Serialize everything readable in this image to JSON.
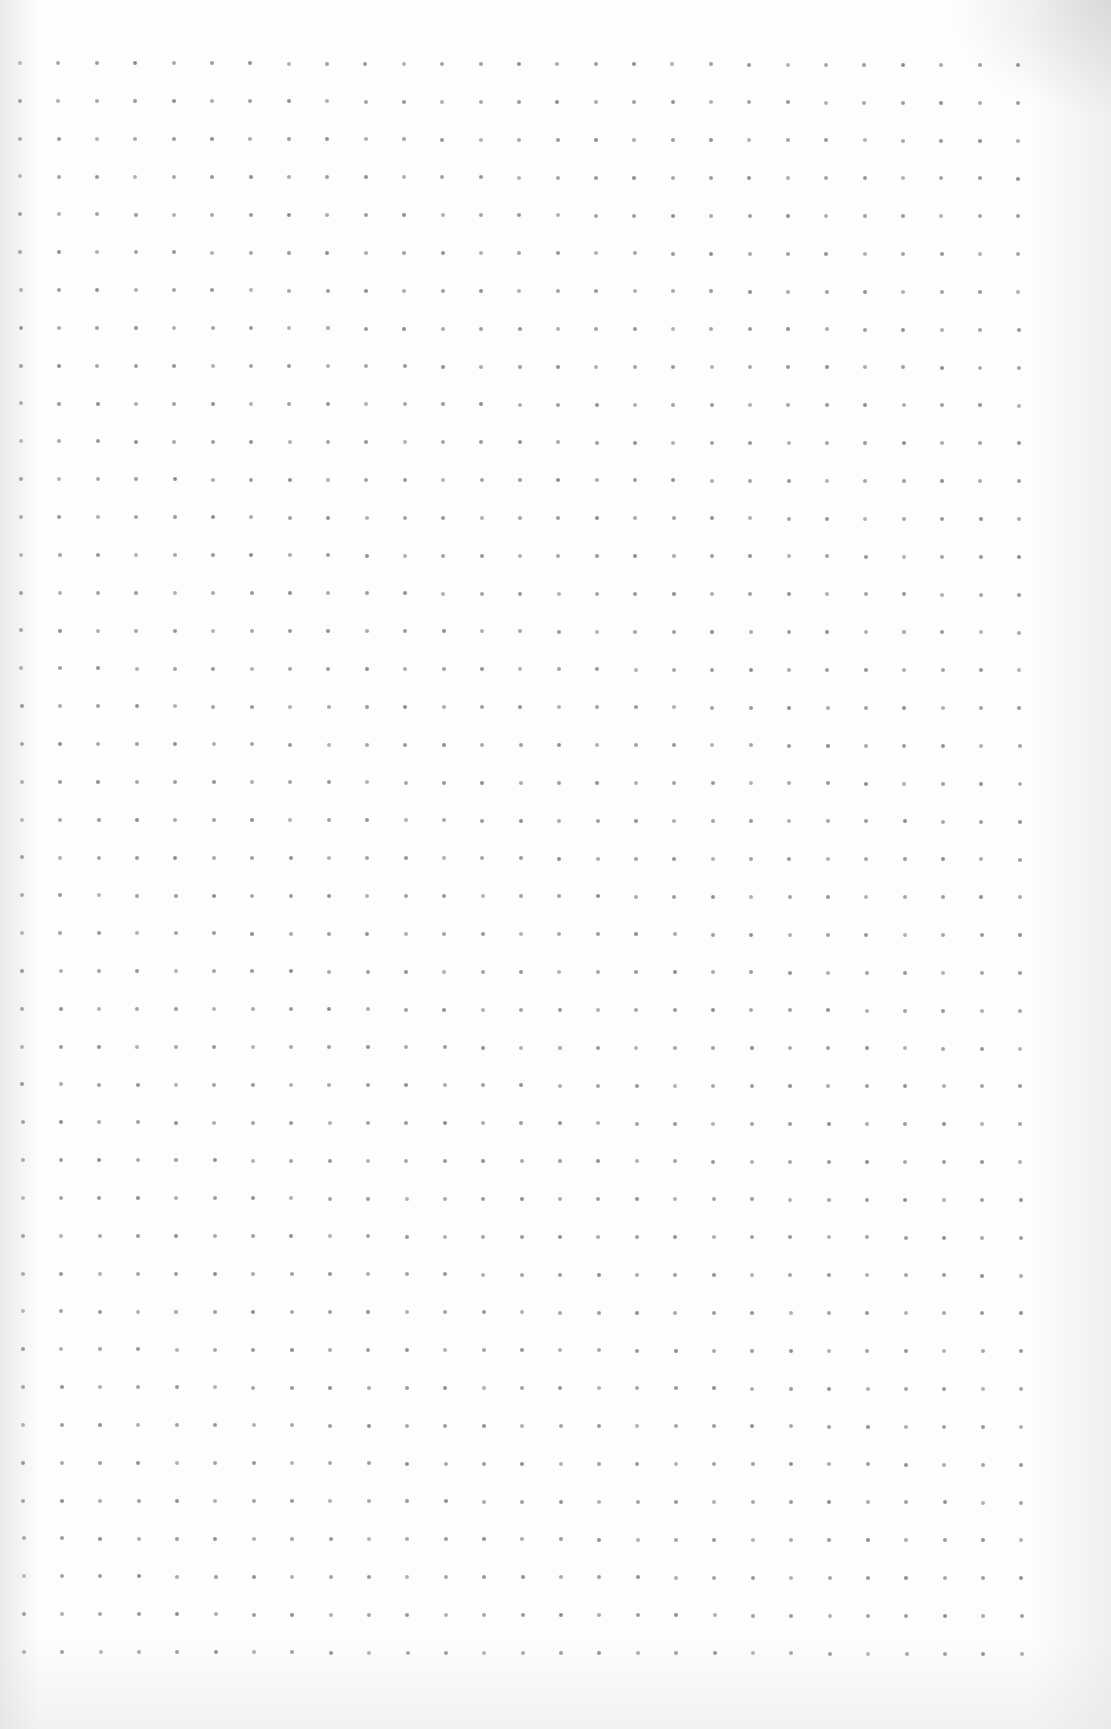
{
  "page": {
    "type": "dot-grid-paper",
    "background_color": "#fdfdfd"
  },
  "grid": {
    "columns": 27,
    "rows": 43,
    "origin_x": 20,
    "origin_y": 63,
    "end_x": 1018,
    "end_y": 1652,
    "spacing_x": 38.38,
    "spacing_y": 37.83,
    "skew_x_per_row": 0.09,
    "skew_y_per_col": 0.08,
    "dot_color": "#8a8a8a",
    "dot_size": 4
  }
}
